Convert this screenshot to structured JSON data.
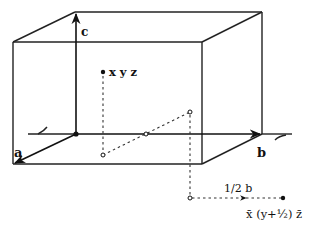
{
  "diagram": {
    "axes": {
      "a_label": "a",
      "b_label": "b",
      "c_label": "c"
    },
    "points": {
      "original_label": "x y z",
      "transformed_label": "x̄ (y+½) z̄"
    },
    "translation_label": "1/2 b",
    "colors": {
      "line": "#222222",
      "background": "#ffffff"
    }
  }
}
